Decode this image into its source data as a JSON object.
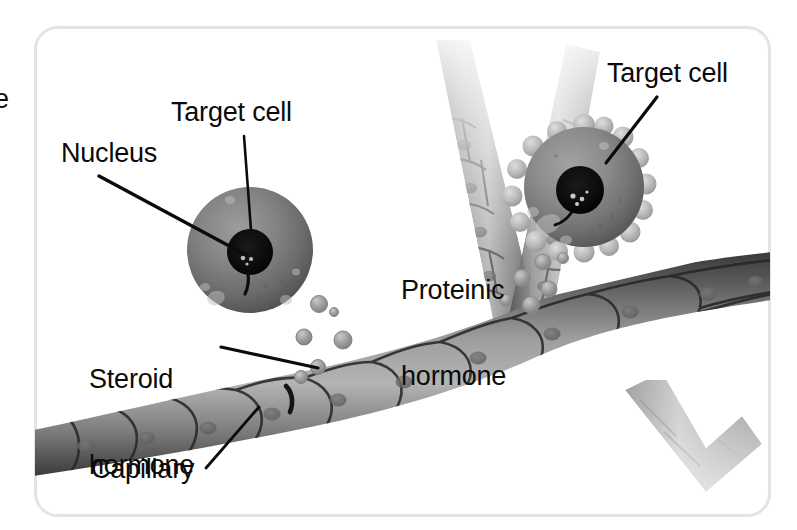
{
  "figure": {
    "frame": {
      "border_color": "#e3e3e3",
      "background_color": "#ffffff",
      "corner_radius": 22
    },
    "text_color": "#0b0b0b",
    "edge_fragment": {
      "text": "e",
      "note": "partially cropped text at left margin"
    }
  },
  "labels": [
    {
      "id": "target-cell-left",
      "text": "Target cell",
      "x": 171,
      "y": 99,
      "leader_from": [
        244,
        136
      ],
      "leader_to": [
        250,
        228
      ]
    },
    {
      "id": "nucleus",
      "text": "Nucleus",
      "x": 61,
      "y": 140,
      "leader_from": [
        99,
        176
      ],
      "leader_to": [
        243,
        253
      ]
    },
    {
      "id": "target-cell-right",
      "text": "Target cell",
      "x": 607,
      "y": 60,
      "leader_from": [
        655,
        97
      ],
      "leader_to": [
        608,
        163
      ]
    },
    {
      "id": "proteinic-hormone",
      "line1": "Proteinic",
      "line2": "hormone",
      "x": 401,
      "y": 219
    },
    {
      "id": "steroid-hormone",
      "line1": "Steroid",
      "line2": "hormone",
      "x": 89,
      "y": 308,
      "leader_from": [
        222,
        348
      ],
      "leader_to": [
        316,
        367
      ]
    },
    {
      "id": "capillary",
      "text": "Capillary",
      "x": 91,
      "y": 456,
      "leader_from": [
        207,
        468
      ],
      "leader_to": [
        258,
        408
      ]
    }
  ],
  "structures": {
    "capillary": {
      "name": "Capillary",
      "description": "branching endothelial vessel with polygonal cells",
      "color_dark": "#3a3a3a",
      "color_mid": "#8c8c8c",
      "color_light": "#d2d2d2"
    },
    "target_cell_left": {
      "name": "Target cell (steroid receptor)",
      "center": [
        250,
        250
      ],
      "radius": 63,
      "nucleus_radius": 23,
      "has_surface_receptors": false
    },
    "target_cell_right": {
      "name": "Target cell (membrane receptor)",
      "center": [
        584,
        187
      ],
      "radius": 60,
      "nucleus_radius": 24,
      "has_surface_receptors": true
    },
    "steroid_hormone_particles": {
      "name": "Steroid hormone",
      "count": 6,
      "color": "#9a9a9a"
    },
    "proteinic_hormone_particles": {
      "name": "Proteinic hormone",
      "count": 6,
      "color": "#a6a6a6"
    }
  }
}
